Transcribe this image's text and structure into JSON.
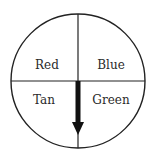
{
  "diagram": {
    "type": "spinner",
    "sections": [
      {
        "label": "Red",
        "position": "top-left"
      },
      {
        "label": "Blue",
        "position": "top-right"
      },
      {
        "label": "Tan",
        "position": "bottom-left"
      },
      {
        "label": "Green",
        "position": "bottom-right"
      }
    ],
    "arrow": {
      "direction": "down",
      "pointing_at": "boundary between Tan and Green"
    },
    "colors": {
      "stroke": "#222222",
      "background": "#ffffff"
    }
  }
}
